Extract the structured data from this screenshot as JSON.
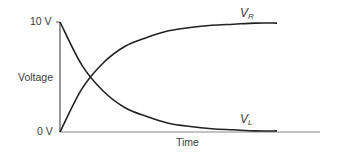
{
  "chart_data": {
    "type": "line",
    "title": "",
    "xlabel": "Time",
    "ylabel": "Voltage",
    "y_ticks": [
      "0 V",
      "10 V"
    ],
    "ylim": [
      0,
      10
    ],
    "grid": false,
    "legend": "inline labels at curve ends",
    "x": [
      0,
      0.5,
      1,
      1.5,
      2,
      2.5,
      3,
      3.5,
      4,
      4.5,
      5
    ],
    "series": [
      {
        "name": "V_R",
        "label_main": "V",
        "label_sub": "R",
        "values": [
          0,
          3.9,
          6.3,
          7.8,
          8.6,
          9.2,
          9.5,
          9.7,
          9.8,
          9.9,
          9.9
        ]
      },
      {
        "name": "V_L",
        "label_main": "V",
        "label_sub": "L",
        "values": [
          10,
          6.1,
          3.7,
          2.2,
          1.4,
          0.8,
          0.5,
          0.3,
          0.2,
          0.1,
          0.1
        ]
      }
    ]
  },
  "labels": {
    "y_top": "10 V",
    "y_bottom": "0 V",
    "y_axis": "Voltage",
    "x_axis": "Time",
    "vr_main": "V",
    "vr_sub": "R",
    "vl_main": "V",
    "vl_sub": "L"
  }
}
